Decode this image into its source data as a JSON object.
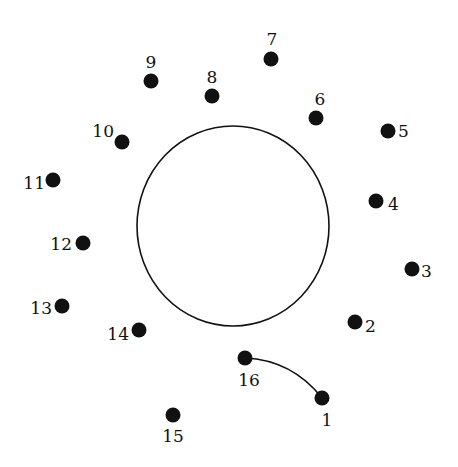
{
  "puzzle": {
    "type": "connect-the-dots",
    "ink_color": "#111111",
    "background": "#ffffff",
    "shape": {
      "kind": "ellipse",
      "cx": 233,
      "cy": 226,
      "rx": 96,
      "ry": 100
    },
    "dots": [
      {
        "n": "1",
        "x": 322,
        "y": 398,
        "lx": 327,
        "ly": 426,
        "anchor": "middle"
      },
      {
        "n": "2",
        "x": 355,
        "y": 322,
        "lx": 365,
        "ly": 332,
        "anchor": "start"
      },
      {
        "n": "3",
        "x": 412,
        "y": 269,
        "lx": 421,
        "ly": 277,
        "anchor": "start"
      },
      {
        "n": "4",
        "x": 376,
        "y": 201,
        "lx": 388,
        "ly": 210,
        "anchor": "start"
      },
      {
        "n": "5",
        "x": 388,
        "y": 131,
        "lx": 398,
        "ly": 137,
        "anchor": "start"
      },
      {
        "n": "6",
        "x": 316,
        "y": 118,
        "lx": 320,
        "ly": 105,
        "anchor": "middle"
      },
      {
        "n": "7",
        "x": 271,
        "y": 59,
        "lx": 272,
        "ly": 45,
        "anchor": "middle"
      },
      {
        "n": "8",
        "x": 212,
        "y": 96,
        "lx": 212,
        "ly": 83,
        "anchor": "middle"
      },
      {
        "n": "9",
        "x": 151,
        "y": 81,
        "lx": 151,
        "ly": 68,
        "anchor": "middle"
      },
      {
        "n": "10",
        "x": 122,
        "y": 142,
        "lx": 114,
        "ly": 137,
        "anchor": "end"
      },
      {
        "n": "11",
        "x": 53,
        "y": 180,
        "lx": 45,
        "ly": 189,
        "anchor": "end"
      },
      {
        "n": "12",
        "x": 83,
        "y": 243,
        "lx": 72,
        "ly": 250,
        "anchor": "end"
      },
      {
        "n": "13",
        "x": 62,
        "y": 306,
        "lx": 52,
        "ly": 314,
        "anchor": "end"
      },
      {
        "n": "14",
        "x": 139,
        "y": 330,
        "lx": 129,
        "ly": 340,
        "anchor": "end"
      },
      {
        "n": "15",
        "x": 173,
        "y": 415,
        "lx": 173,
        "ly": 442,
        "anchor": "middle"
      },
      {
        "n": "16",
        "x": 245,
        "y": 358,
        "lx": 249,
        "ly": 386,
        "anchor": "middle"
      }
    ],
    "connector": {
      "from": "16",
      "to": "1",
      "path": "M245,358 Q292,360 322,398"
    }
  }
}
